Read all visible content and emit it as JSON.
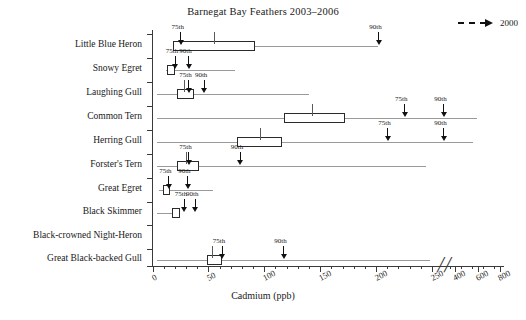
{
  "chart_data": {
    "type": "boxplot",
    "title": "Barnegat Bay Feathers 2003–2006",
    "xlabel": "Cadmium (ppb)",
    "ylabel": "",
    "grid": false,
    "axis_break_after": 250,
    "xticks_main": [
      0,
      50,
      100,
      150,
      200,
      250
    ],
    "xticks_compressed": [
      400,
      600,
      800
    ],
    "legend": {
      "position": "top-right",
      "entries": [
        {
          "label": "2000",
          "style": "dashed-arrow"
        }
      ]
    },
    "categories": [
      "Little Blue Heron",
      "Snowy Egret",
      "Laughing Gull",
      "Common Tern",
      "Herring Gull",
      "Forster's Tern",
      "Great Egret",
      "Black Skimmer",
      "Black-crowned Night-Heron",
      "Great Black-backed Gull"
    ],
    "marker_labels": {
      "p75": "75th",
      "p90": "90th"
    },
    "series": [
      {
        "name": "Little Blue Heron",
        "whisker_low": 18,
        "box_low": 18,
        "median": 55,
        "box_high": 92,
        "whisker_high": 202,
        "p75": 25,
        "p90": 202,
        "has_data": true
      },
      {
        "name": "Snowy Egret",
        "whisker_low": 12,
        "box_low": 13,
        "median": 17,
        "box_high": 20,
        "whisker_high": 74,
        "p75": 20,
        "p90": 32,
        "has_data": true
      },
      {
        "name": "Laughing Gull",
        "whisker_low": 4,
        "box_low": 22,
        "median": 28,
        "box_high": 37,
        "whisker_high": 140,
        "p75": 32,
        "p90": 46,
        "has_data": true
      },
      {
        "name": "Common Tern",
        "whisker_low": 4,
        "box_low": 118,
        "median": 143,
        "box_high": 172,
        "whisker_high": 600,
        "p75": 225,
        "p90": 256,
        "has_data": true
      },
      {
        "name": "Herring Gull",
        "whisker_low": 4,
        "box_low": 76,
        "median": 96,
        "box_high": 116,
        "whisker_high": 560,
        "p75": 210,
        "p90": 255,
        "has_data": true
      },
      {
        "name": "Forster's Tern",
        "whisker_low": 4,
        "box_low": 22,
        "median": 30,
        "box_high": 42,
        "whisker_high": 245,
        "p75": 32,
        "p90": 78,
        "has_data": true
      },
      {
        "name": "Great Egret",
        "whisker_low": 6,
        "box_low": 9,
        "median": 12,
        "box_high": 16,
        "whisker_high": 54,
        "p75": 14,
        "p90": 31,
        "has_data": true
      },
      {
        "name": "Black Skimmer",
        "whisker_low": 4,
        "box_low": 17,
        "median": 21,
        "box_high": 25,
        "whisker_high": 25,
        "p75": 28,
        "p90": 38,
        "has_data": true
      },
      {
        "name": "Black-crowned Night-Heron",
        "has_data": false
      },
      {
        "name": "Great Black-backed Gull",
        "whisker_low": 4,
        "box_low": 49,
        "median": 53,
        "box_high": 62,
        "whisker_high": 248,
        "p75": 62,
        "p90": 117,
        "has_data": true
      }
    ]
  },
  "colors": {
    "axis": "#3a3a3a",
    "box_stroke": "#2a2a2a",
    "box_fill": "#ffffff",
    "whisker": "#9a9a9a",
    "marker": "#111111",
    "text": "#202020"
  }
}
